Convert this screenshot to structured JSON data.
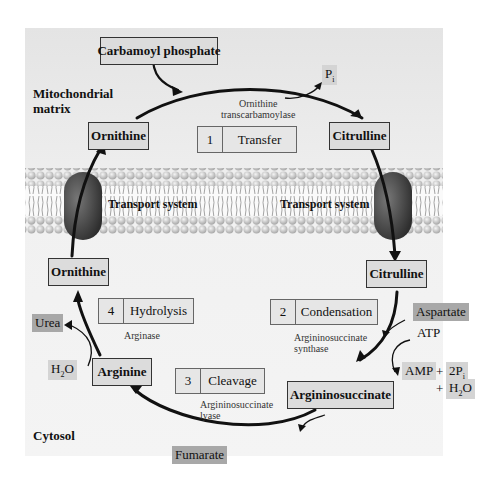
{
  "diagram": {
    "regions": {
      "matrix": "Mitochondrial\nmatrix",
      "matrix_line1": "Mitochondrial",
      "matrix_line2": "matrix",
      "cytosol": "Cytosol"
    },
    "metabolites": {
      "carbamoyl_phosphate": "Carbamoyl phosphate",
      "ornithine_matrix": "Ornithine",
      "citrulline_matrix": "Citrulline",
      "ornithine_cytosol": "Ornithine",
      "citrulline_cytosol": "Citrulline",
      "arginine": "Arginine",
      "argininosuccinate": "Argininosuccinate"
    },
    "steps": [
      {
        "num": "1",
        "name": "Transfer",
        "enzyme_line1": "Ornithine",
        "enzyme_line2": "transcarbamoylase"
      },
      {
        "num": "2",
        "name": "Condensation",
        "enzyme_line1": "Argininosuccinate",
        "enzyme_line2": "synthase"
      },
      {
        "num": "3",
        "name": "Cleavage",
        "enzyme_line1": "Argininosuccinate",
        "enzyme_line2": "lyase"
      },
      {
        "num": "4",
        "name": "Hydrolysis",
        "enzyme_line1": "Arginase",
        "enzyme_line2": ""
      }
    ],
    "side_species": {
      "pi": "P",
      "pi_sub": "i",
      "aspartate": "Aspartate",
      "atp": "ATP",
      "amp": "AMP",
      "plus1": "+",
      "two_pi": "2P",
      "two_pi_sub": "i",
      "plus2": "+",
      "h2o_a": "H",
      "h2o_sub": "2",
      "h2o_b": "O",
      "fumarate": "Fumarate",
      "urea": "Urea",
      "h2o_left_a": "H",
      "h2o_left_sub": "2",
      "h2o_left_b": "O"
    },
    "transport": {
      "left": "Transport system",
      "right": "Transport system"
    },
    "colors": {
      "panel": "#ececec",
      "box": "#dcdcdc",
      "tag": "#d4d4d4",
      "tag_dark": "#a8a8a8",
      "transporter": "#4a4a4a",
      "lipid_head": "#c8c8c8"
    }
  }
}
